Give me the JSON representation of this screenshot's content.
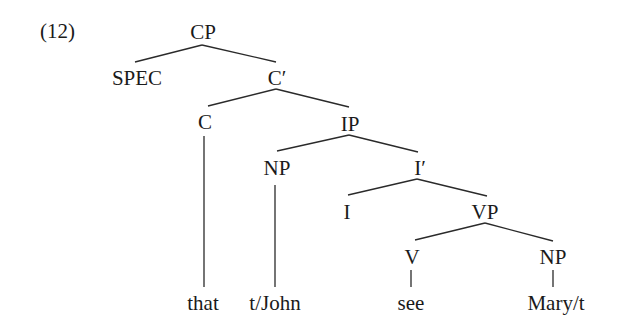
{
  "example_number": "(12)",
  "tree": {
    "nodes": {
      "cp": "CP",
      "spec": "SPEC",
      "c_bar": "C′",
      "c": "C",
      "ip": "IP",
      "np_subj": "NP",
      "i_bar": "I′",
      "i": "I",
      "vp": "VP",
      "v": "V",
      "np_obj": "NP"
    },
    "leaves": {
      "that": "that",
      "subject": "t/John",
      "verb": "see",
      "object": "Mary/t"
    },
    "edges": [
      [
        "CP",
        "SPEC"
      ],
      [
        "CP",
        "C′"
      ],
      [
        "C′",
        "C"
      ],
      [
        "C′",
        "IP"
      ],
      [
        "C",
        "that"
      ],
      [
        "IP",
        "NP"
      ],
      [
        "IP",
        "I′"
      ],
      [
        "NP",
        "t/John"
      ],
      [
        "I′",
        "I"
      ],
      [
        "I′",
        "VP"
      ],
      [
        "VP",
        "V"
      ],
      [
        "VP",
        "NP"
      ],
      [
        "V",
        "see"
      ],
      [
        "NP",
        "Mary/t"
      ]
    ]
  }
}
